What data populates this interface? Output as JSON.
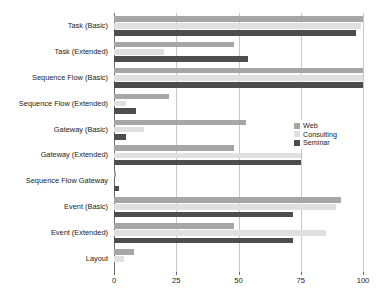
{
  "chart_data": {
    "type": "bar",
    "orientation": "horizontal",
    "title": "",
    "subtitle": "",
    "xlabel": "",
    "ylabel": "",
    "xlim": [
      0,
      100
    ],
    "xticks": [
      0,
      25,
      50,
      75,
      100
    ],
    "xtick_labels": [
      "0",
      "25",
      "50",
      "75",
      "100"
    ],
    "grid": true,
    "grid_axis": "x",
    "legend_position": "center-right",
    "categories": [
      "Task (Basic)",
      "Task (Extended)",
      "Sequence Flow (Basic)",
      "Sequence Flow (Extended)",
      "Gateway (Basic)",
      "Gateway (Extended)",
      "Sequence Flow Gateway",
      "Event (Basic)",
      "Event (Extended)",
      "Layout"
    ],
    "series": [
      {
        "name": "Web",
        "color": "#a6a6a6",
        "values": [
          100,
          48,
          100,
          22,
          53,
          48,
          1,
          91,
          48,
          8
        ]
      },
      {
        "name": "Consulting",
        "color": "#e0e0e0",
        "values": [
          99,
          20,
          100,
          5,
          12,
          75,
          0,
          89,
          85,
          4
        ]
      },
      {
        "name": "Seminar",
        "color": "#4d4d4d",
        "values": [
          97,
          54,
          100,
          9,
          5,
          75,
          2,
          72,
          72,
          0
        ]
      }
    ]
  },
  "legend": {
    "items": [
      {
        "label": "Web",
        "color": "#a6a6a6"
      },
      {
        "label": "Consulting",
        "color": "#e0e0e0"
      },
      {
        "label": "Seminar",
        "color": "#4d4d4d"
      }
    ]
  },
  "style": {
    "gridline_color": "#c8c8c8",
    "axis_color": "#6b6b6b",
    "background": "#ffffff",
    "text_color": "#1a1a1a"
  }
}
